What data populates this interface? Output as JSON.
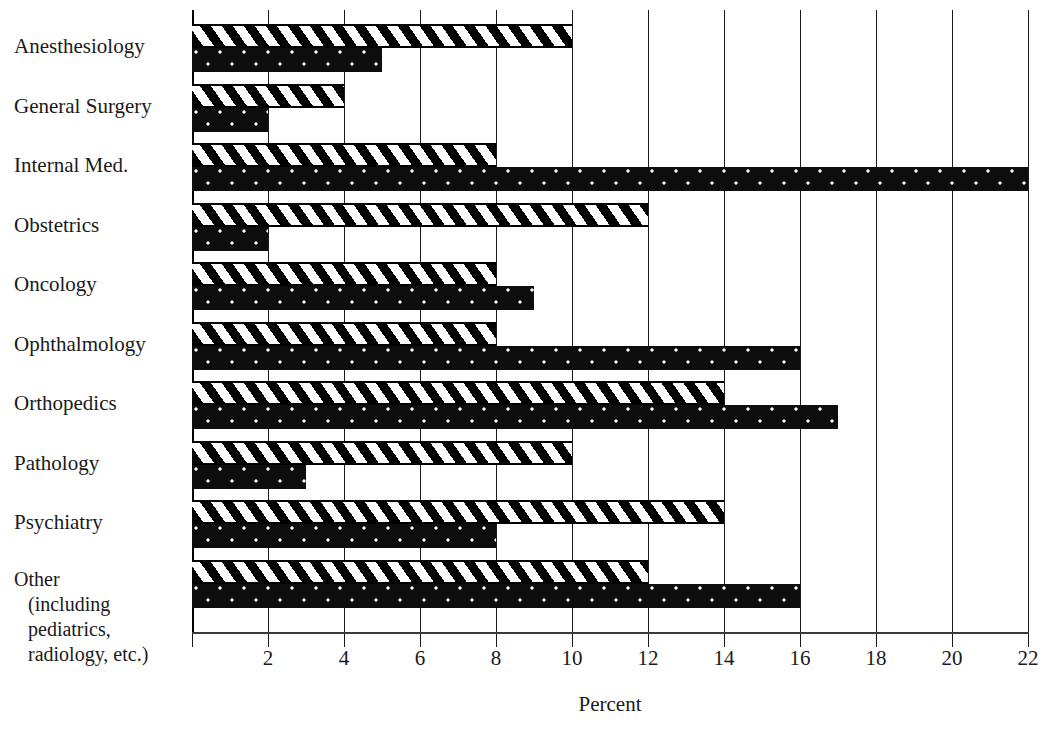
{
  "chart_data": {
    "type": "bar",
    "orientation": "horizontal",
    "title": "",
    "subtitle": "",
    "xlabel": "Percent",
    "ylabel": "",
    "xlim": [
      0,
      22
    ],
    "xticks": [
      0,
      2,
      4,
      6,
      8,
      10,
      12,
      14,
      16,
      18,
      20,
      22
    ],
    "xticklabels": [
      "",
      "2",
      "4",
      "6",
      "8",
      "10",
      "12",
      "14",
      "16",
      "18",
      "20",
      "22"
    ],
    "grid": "vertical",
    "legend": "none",
    "categories": [
      "Anesthesiology",
      "General Surgery",
      "Internal Med.",
      "Obstetrics",
      "Oncology",
      "Ophthalmology",
      "Orthopedics",
      "Pathology",
      "Psychiatry",
      "Other\n(including\npediatrics,\nradiology, etc.)"
    ],
    "series": [
      {
        "name": "hatched",
        "pattern": "diagonal-stripes",
        "color": "#000000",
        "values": [
          10,
          4,
          8,
          12,
          8,
          8,
          14,
          10,
          14,
          12
        ]
      },
      {
        "name": "solid",
        "pattern": "solid-speckled",
        "color": "#0d0d0d",
        "values": [
          5,
          2,
          22,
          2,
          9,
          16,
          17,
          3,
          8,
          16
        ]
      }
    ]
  },
  "axis": {
    "x_title": "Percent"
  },
  "labels": {
    "other_line1": "Other",
    "other_line2": "(including",
    "other_line3": "pediatrics,",
    "other_line4": "radiology, etc.)"
  },
  "colors": {
    "ink": "#111111",
    "grid": "#1a1a1a",
    "bar_solid": "#0d0d0d",
    "background": "#ffffff"
  }
}
